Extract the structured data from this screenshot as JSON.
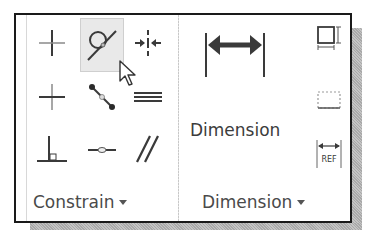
{
  "panels": {
    "constrain": {
      "label": "Constrain",
      "tools": [
        {
          "name": "coincident-icon",
          "row": 0,
          "col": 0
        },
        {
          "name": "tangent-icon",
          "row": 0,
          "col": 1,
          "hover": true
        },
        {
          "name": "symmetric-icon",
          "row": 0,
          "col": 2
        },
        {
          "name": "fix-icon",
          "row": 1,
          "col": 0
        },
        {
          "name": "collinear-icon",
          "row": 1,
          "col": 1
        },
        {
          "name": "equal-icon",
          "row": 1,
          "col": 2
        },
        {
          "name": "perpendicular-icon",
          "row": 2,
          "col": 0
        },
        {
          "name": "concentric-icon",
          "row": 2,
          "col": 1
        },
        {
          "name": "parallel-icon",
          "row": 2,
          "col": 2
        }
      ]
    },
    "dimension": {
      "label": "Dimension",
      "main_tool_label": "Dimension",
      "side_tools": [
        {
          "name": "auto-dimension-icon"
        },
        {
          "name": "show-constraints-icon"
        },
        {
          "name": "driven-dimension-icon",
          "text": "REF"
        }
      ]
    }
  },
  "colors": {
    "border": "#1a1a1a",
    "icon": "#3a3a3a",
    "label": "#4a4a4a",
    "hover_bg": "#e9e9e9"
  }
}
